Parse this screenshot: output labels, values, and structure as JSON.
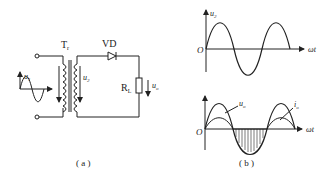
{
  "figure_a": {
    "caption": "( a )",
    "transformer_label": "T",
    "transformer_sub": "r",
    "diode_label": "VD",
    "resistor_label": "R",
    "resistor_sub": "L",
    "input_voltage": "u",
    "input_voltage_sub": "1",
    "secondary_voltage": "u",
    "secondary_voltage_sub": "2",
    "output_voltage": "u",
    "output_voltage_sub": "o"
  },
  "figure_b": {
    "caption": "( b )",
    "top_plot": {
      "ylabel": "u",
      "ylabel_sub": "2",
      "xlabel": "ωt",
      "origin": "O"
    },
    "bottom_plot": {
      "curve1": "u",
      "curve1_sub": "o",
      "curve2": "i",
      "curve2_sub": "o",
      "xlabel": "ωt",
      "origin": "O"
    }
  },
  "colors": {
    "ink": "#222222",
    "background": "#ffffff"
  }
}
